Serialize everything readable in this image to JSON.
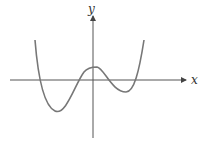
{
  "diagram": {
    "type": "function-graph",
    "axes": {
      "x_label": "x",
      "y_label": "y"
    },
    "colors": {
      "axis": "#555555",
      "curve": "#777777",
      "background": "#ffffff"
    },
    "curve_shape": "quartic with two local minima (left deeper) and one local maximum above origin",
    "features": {
      "x_intercepts": 4,
      "local_maximum": "just above the y-axis intercept, positive y",
      "left_minimum": "deep, left of y-axis",
      "right_minimum": "shallow, right of y-axis"
    }
  }
}
